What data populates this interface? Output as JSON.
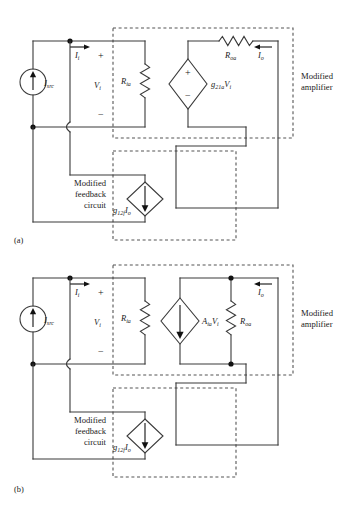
{
  "figure": {
    "width": 359,
    "height": 510,
    "background": "#ffffff",
    "wire_color": "#3a3a3a",
    "dash_color": "#555555",
    "text_color": "#1a1a1a"
  },
  "panels": [
    {
      "id": "a",
      "caption": "(a)",
      "source": {
        "label": "I",
        "sub": "src",
        "arrow": "up"
      },
      "input_current": {
        "label": "I",
        "sub": "i",
        "arrow": "right"
      },
      "input_voltage": {
        "label": "V",
        "sub": "i",
        "plus": "+",
        "minus": "−"
      },
      "input_resistor": {
        "label": "R",
        "sub": "ia",
        "type": "resistor-zigzag"
      },
      "dependent_source": {
        "kind": "voltage",
        "shape": "diamond",
        "plus": "+",
        "minus": "−",
        "label": "g",
        "sub": "21a",
        "label2": "V",
        "sub2": "i"
      },
      "output_resistor": {
        "label": "R",
        "sub": "oa",
        "type": "resistor-zigzag"
      },
      "output_current": {
        "label": "I",
        "sub": "o",
        "arrow": "left"
      },
      "amplifier_box": {
        "line1": "Modified",
        "line2": "amplifier"
      },
      "feedback_box": {
        "line1": "Modified",
        "line2": "feedback",
        "line3": "circuit"
      },
      "feedback_source": {
        "kind": "current",
        "shape": "diamond",
        "arrow": "down",
        "label": "g",
        "sub": "12f",
        "label2": "I",
        "sub2": "o"
      }
    },
    {
      "id": "b",
      "caption": "(b)",
      "source": {
        "label": "I",
        "sub": "src",
        "arrow": "up"
      },
      "input_current": {
        "label": "I",
        "sub": "i",
        "arrow": "right"
      },
      "input_voltage": {
        "label": "V",
        "sub": "i",
        "plus": "+",
        "minus": "−"
      },
      "input_resistor": {
        "label": "R",
        "sub": "ia",
        "type": "resistor-zigzag"
      },
      "dependent_source": {
        "kind": "current",
        "shape": "diamond",
        "arrow": "down",
        "label": "A",
        "sub": "ia",
        "label2": "V",
        "sub2": "i"
      },
      "output_resistor": {
        "label": "R",
        "sub": "oa",
        "type": "resistor-zigzag"
      },
      "output_current": {
        "label": "I",
        "sub": "o",
        "arrow": "left"
      },
      "amplifier_box": {
        "line1": "Modified",
        "line2": "amplifier"
      },
      "feedback_box": {
        "line1": "Modified",
        "line2": "feedback",
        "line3": "circuit"
      },
      "feedback_source": {
        "kind": "current",
        "shape": "diamond",
        "arrow": "down",
        "label": "g",
        "sub": "12f",
        "label2": "I",
        "sub2": "o"
      }
    }
  ]
}
